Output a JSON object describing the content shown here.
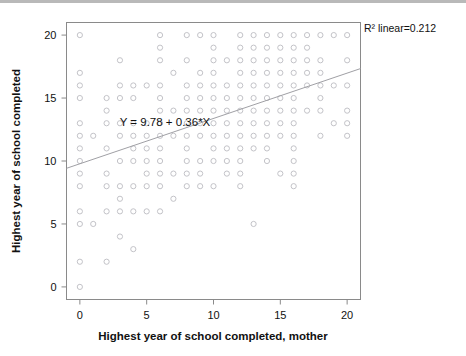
{
  "chart_data": {
    "type": "scatter",
    "title": "",
    "xlabel": "Highest year of school completed, mother",
    "ylabel": "Highest year of school completed",
    "xlim": [
      -1,
      21
    ],
    "ylim": [
      -1,
      21
    ],
    "xticks": [
      0,
      5,
      10,
      15,
      20
    ],
    "yticks": [
      0,
      5,
      10,
      15,
      20
    ],
    "xtick_labels": [
      "0",
      "5",
      "10",
      "15",
      "20"
    ],
    "ytick_labels": [
      "0",
      "5",
      "10",
      "15",
      "20"
    ],
    "grid": false,
    "legend": "none",
    "marker_style": "open-circle",
    "marker_color": "#c3c3c8",
    "fit_line_color": "#a0a0a5",
    "annotations": {
      "equation": "Y = 9.78 + 0.36*X",
      "r_squared": "R² linear=0.212"
    },
    "fit": {
      "intercept": 9.78,
      "slope": 0.36,
      "r_squared": 0.212,
      "x_start": -1,
      "x_end": 21,
      "y_start": 9.42,
      "y_end": 17.34
    },
    "points": [
      [
        0,
        20
      ],
      [
        6,
        20
      ],
      [
        8,
        20
      ],
      [
        9,
        20
      ],
      [
        10,
        20
      ],
      [
        12,
        20
      ],
      [
        13,
        20
      ],
      [
        14,
        20
      ],
      [
        15,
        20
      ],
      [
        16,
        20
      ],
      [
        17,
        20
      ],
      [
        18,
        20
      ],
      [
        19,
        20
      ],
      [
        20,
        20
      ],
      [
        6,
        19
      ],
      [
        10,
        19
      ],
      [
        12,
        19
      ],
      [
        13,
        19
      ],
      [
        14,
        19
      ],
      [
        15,
        19
      ],
      [
        16,
        19
      ],
      [
        17,
        19
      ],
      [
        3,
        18
      ],
      [
        6,
        18
      ],
      [
        8,
        18
      ],
      [
        10,
        18
      ],
      [
        11,
        18
      ],
      [
        12,
        18
      ],
      [
        13,
        18
      ],
      [
        14,
        18
      ],
      [
        15,
        18
      ],
      [
        16,
        18
      ],
      [
        17,
        18
      ],
      [
        18,
        18
      ],
      [
        20,
        18
      ],
      [
        0,
        17
      ],
      [
        7,
        17
      ],
      [
        9,
        17
      ],
      [
        10,
        17
      ],
      [
        12,
        17
      ],
      [
        13,
        17
      ],
      [
        14,
        17
      ],
      [
        15,
        17
      ],
      [
        16,
        17
      ],
      [
        17,
        17
      ],
      [
        18,
        17
      ],
      [
        0,
        16
      ],
      [
        3,
        16
      ],
      [
        4,
        16
      ],
      [
        5,
        16
      ],
      [
        6,
        16
      ],
      [
        8,
        16
      ],
      [
        9,
        16
      ],
      [
        10,
        16
      ],
      [
        11,
        16
      ],
      [
        12,
        16
      ],
      [
        13,
        16
      ],
      [
        14,
        16
      ],
      [
        15,
        16
      ],
      [
        16,
        16
      ],
      [
        17,
        16
      ],
      [
        18,
        16
      ],
      [
        19,
        16
      ],
      [
        20,
        16
      ],
      [
        0,
        15
      ],
      [
        2,
        15
      ],
      [
        3,
        15
      ],
      [
        4,
        15
      ],
      [
        6,
        15
      ],
      [
        8,
        15
      ],
      [
        9,
        15
      ],
      [
        10,
        15
      ],
      [
        11,
        15
      ],
      [
        12,
        15
      ],
      [
        13,
        15
      ],
      [
        14,
        15
      ],
      [
        15,
        15
      ],
      [
        16,
        15
      ],
      [
        18,
        15
      ],
      [
        2,
        14
      ],
      [
        6,
        14
      ],
      [
        7,
        14
      ],
      [
        8,
        14
      ],
      [
        9,
        14
      ],
      [
        10,
        14
      ],
      [
        11,
        14
      ],
      [
        12,
        14
      ],
      [
        13,
        14
      ],
      [
        14,
        14
      ],
      [
        15,
        14
      ],
      [
        16,
        14
      ],
      [
        17,
        14
      ],
      [
        18,
        14
      ],
      [
        20,
        14
      ],
      [
        0,
        13
      ],
      [
        2,
        13
      ],
      [
        3,
        13
      ],
      [
        4,
        13
      ],
      [
        5,
        13
      ],
      [
        6,
        13
      ],
      [
        8,
        13
      ],
      [
        9,
        13
      ],
      [
        10,
        13
      ],
      [
        11,
        13
      ],
      [
        12,
        13
      ],
      [
        13,
        13
      ],
      [
        14,
        13
      ],
      [
        15,
        13
      ],
      [
        16,
        13
      ],
      [
        19,
        13
      ],
      [
        20,
        13
      ],
      [
        0,
        12
      ],
      [
        1,
        12
      ],
      [
        3,
        12
      ],
      [
        4,
        12
      ],
      [
        5,
        12
      ],
      [
        6,
        12
      ],
      [
        7,
        12
      ],
      [
        8,
        12
      ],
      [
        9,
        12
      ],
      [
        10,
        12
      ],
      [
        11,
        12
      ],
      [
        12,
        12
      ],
      [
        13,
        12
      ],
      [
        14,
        12
      ],
      [
        15,
        12
      ],
      [
        16,
        12
      ],
      [
        18,
        12
      ],
      [
        20,
        12
      ],
      [
        0,
        11
      ],
      [
        2,
        11
      ],
      [
        4,
        11
      ],
      [
        5,
        11
      ],
      [
        6,
        11
      ],
      [
        8,
        11
      ],
      [
        10,
        11
      ],
      [
        11,
        11
      ],
      [
        12,
        11
      ],
      [
        13,
        11
      ],
      [
        14,
        11
      ],
      [
        16,
        11
      ],
      [
        0,
        10
      ],
      [
        3,
        10
      ],
      [
        4,
        10
      ],
      [
        5,
        10
      ],
      [
        6,
        10
      ],
      [
        8,
        10
      ],
      [
        9,
        10
      ],
      [
        10,
        10
      ],
      [
        11,
        10
      ],
      [
        12,
        10
      ],
      [
        14,
        10
      ],
      [
        16,
        10
      ],
      [
        0,
        9
      ],
      [
        2,
        9
      ],
      [
        5,
        9
      ],
      [
        6,
        9
      ],
      [
        7,
        9
      ],
      [
        8,
        9
      ],
      [
        9,
        9
      ],
      [
        11,
        9
      ],
      [
        12,
        9
      ],
      [
        15,
        9
      ],
      [
        16,
        9
      ],
      [
        0,
        8
      ],
      [
        2,
        8
      ],
      [
        3,
        8
      ],
      [
        4,
        8
      ],
      [
        5,
        8
      ],
      [
        6,
        8
      ],
      [
        8,
        8
      ],
      [
        9,
        8
      ],
      [
        10,
        8
      ],
      [
        12,
        8
      ],
      [
        16,
        8
      ],
      [
        3,
        7
      ],
      [
        7,
        7
      ],
      [
        0,
        6
      ],
      [
        2,
        6
      ],
      [
        3,
        6
      ],
      [
        4,
        6
      ],
      [
        5,
        6
      ],
      [
        6,
        6
      ],
      [
        0,
        5
      ],
      [
        1,
        5
      ],
      [
        13,
        5
      ],
      [
        3,
        4
      ],
      [
        4,
        3
      ],
      [
        0,
        2
      ],
      [
        2,
        2
      ],
      [
        0,
        0
      ]
    ]
  }
}
